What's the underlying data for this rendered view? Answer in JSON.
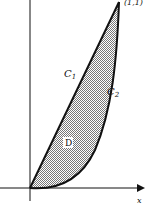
{
  "figure": {
    "curves": [
      {
        "id": "C1",
        "label": "C",
        "subscript": "1",
        "description": "line from origin to (1,1)"
      },
      {
        "id": "C2",
        "label": "C",
        "subscript": "2",
        "description": "convex curve from origin to (1,1)"
      }
    ],
    "region_label": "D",
    "x_axis_label": "x",
    "corner_point_label": "(1,1)",
    "colors": {
      "stroke": "#111111",
      "fill": "#b8b8b8",
      "background": "#ffffff"
    }
  }
}
